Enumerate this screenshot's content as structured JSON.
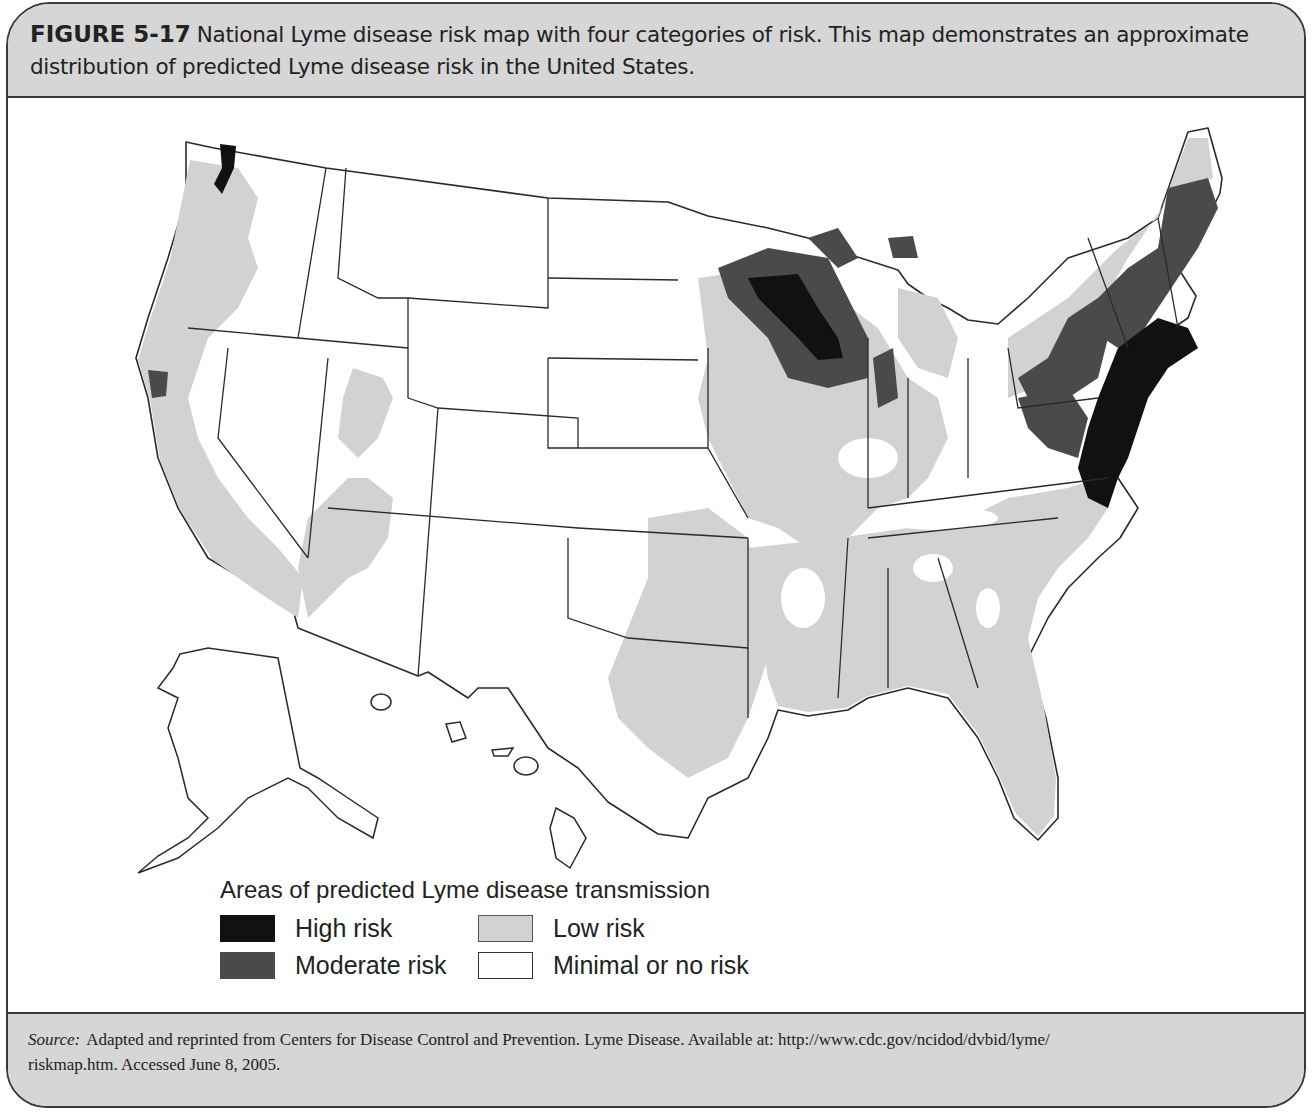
{
  "figure": {
    "label": "FIGURE 5-17",
    "caption_line1": "National Lyme disease risk map with four categories of risk. This map demonstrates an approximate",
    "caption_line2": "distribution of predicted Lyme disease risk in the United States."
  },
  "map": {
    "subject": "Predicted Lyme disease risk, United States (incl. Alaska and Hawaii insets)",
    "colors": {
      "high": "#111111",
      "moderate": "#4a4a4a",
      "low": "#d2d2d2",
      "minimal": "#ffffff",
      "border": "#2a2a2a"
    },
    "regions": {
      "high": [
        "Northeast corridor (MA, CT, RI, NJ, southeastern NY)",
        "Eastern PA / MD / DE / Chesapeake",
        "Northwestern Wisconsin / eastern Minnesota"
      ],
      "moderate": [
        "Maine, New Hampshire, Vermont",
        "Upstate New York",
        "Pennsylvania patches",
        "Wisconsin/Minnesota fringe",
        "Upper Michigan patches",
        "Northwestern Indiana / Illinois",
        "Northern California coast",
        "Puget Sound"
      ],
      "low": [
        "Pacific coast (WA, OR, CA)",
        "Utah / Nevada patches",
        "Iowa, Missouri, Illinois",
        "Southeast US (AR, LA, MS, AL, GA, SC, NC, FL)",
        "Eastern Texas / Oklahoma"
      ],
      "minimal": [
        "Mountain West",
        "Great Plains",
        "Southwest",
        "Alaska",
        "Hawaii"
      ]
    }
  },
  "legend": {
    "title": "Areas of predicted Lyme disease transmission",
    "items": [
      {
        "label": "High risk",
        "color": "#111111"
      },
      {
        "label": "Low risk",
        "color": "#d2d2d2"
      },
      {
        "label": "Moderate risk",
        "color": "#4a4a4a"
      },
      {
        "label": "Minimal or no risk",
        "color": "#ffffff"
      }
    ]
  },
  "source": {
    "label": "Source:",
    "line1": "Adapted and reprinted from Centers for Disease Control and Prevention. Lyme Disease. Available at: http://www.cdc.gov/ncidod/dvbid/lyme/",
    "line2": "riskmap.htm. Accessed June 8, 2005."
  }
}
